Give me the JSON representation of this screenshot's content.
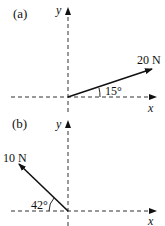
{
  "panels": [
    {
      "label": "(a)",
      "force_label": "20 N",
      "angle_label": "15°",
      "x_axis": "x",
      "y_axis": "y",
      "magnitude_N": 20,
      "angle_deg": 15,
      "reference": "above +x axis"
    },
    {
      "label": "(b)",
      "force_label": "10 N",
      "angle_label": "42°",
      "x_axis": "x",
      "y_axis": "y",
      "magnitude_N": 10,
      "angle_deg": 42,
      "reference": "above -x axis"
    }
  ]
}
